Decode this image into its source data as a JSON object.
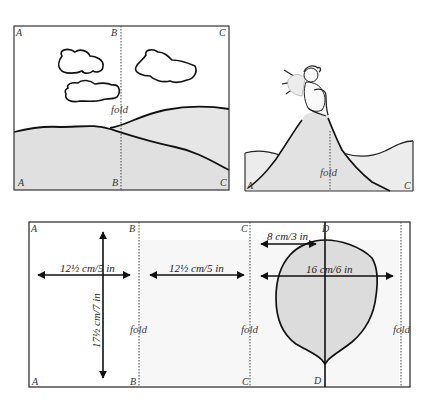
{
  "panel_top_left": {
    "corners": {
      "tl": "A",
      "tm": "B",
      "tr": "C",
      "bl": "A",
      "bm": "B",
      "br": "C"
    },
    "fold_label": "fold"
  },
  "panel_top_right": {
    "corners": {
      "bl": "A",
      "br": "C"
    },
    "fold_label": "fold",
    "figure": "cherub on hilltop"
  },
  "panel_bottom": {
    "corners": {
      "tA": "A",
      "tB": "B",
      "tC": "C",
      "tD": "D",
      "bA": "A",
      "bB": "B",
      "bC": "C",
      "bD": "D"
    },
    "fold_labels": [
      "fold",
      "fold",
      "fold"
    ],
    "dimensions": {
      "width_ab": "12½ cm/5 in",
      "width_bc": "12½ cm/5 in",
      "height": "17½ cm/7 in",
      "half_width_leaf": "8 cm/3 in",
      "width_leaf": "16 cm/6 in"
    }
  },
  "colors": {
    "line": "#1a1a1a",
    "fill_gray": "#e4e4e4",
    "fold_line": "#555555",
    "background": "#ffffff"
  }
}
